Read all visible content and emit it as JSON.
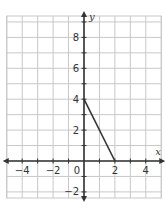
{
  "chart_data": {
    "type": "line",
    "title": "",
    "xlabel": "x",
    "ylabel": "y",
    "xlim": [
      -5,
      5
    ],
    "ylim": [
      -2.4,
      9.4
    ],
    "grid": true,
    "legend": null,
    "x_ticks": [
      -4,
      -2,
      0,
      2,
      4
    ],
    "x_tick_labels": [
      "−4",
      "−2",
      "0",
      "2",
      "4"
    ],
    "y_ticks": [
      8,
      6,
      4,
      2,
      -2
    ],
    "y_tick_labels": [
      "8",
      "6",
      "4",
      "2",
      "−2"
    ],
    "series": [
      {
        "name": "segment",
        "points": [
          [
            0,
            4
          ],
          [
            2,
            0
          ]
        ],
        "color": "#333333"
      }
    ]
  },
  "colors": {
    "grid": "#c8c8c8",
    "axis": "#333333",
    "border": "#c8c8c8",
    "background": "#ffffff"
  }
}
